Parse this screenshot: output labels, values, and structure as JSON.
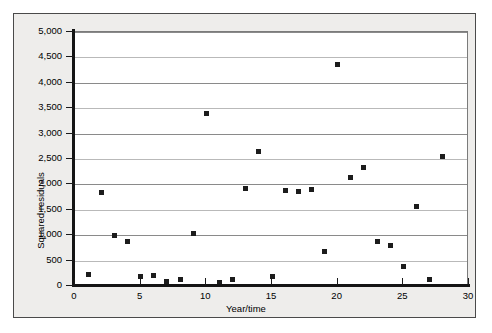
{
  "chart_data": {
    "type": "scatter",
    "title": "",
    "xlabel": "Year/time",
    "ylabel": "Squared residuals",
    "xlim": [
      0,
      30
    ],
    "ylim": [
      0,
      5000
    ],
    "grid": "horizontal",
    "legend": "none",
    "marker": "square",
    "marker_color": "#1c1c1c",
    "xticks": [
      0,
      5,
      10,
      15,
      20,
      25,
      30
    ],
    "xtick_labels": [
      "0",
      "5",
      "10",
      "15",
      "20",
      "25",
      "30"
    ],
    "yticks": [
      0,
      500,
      1000,
      1500,
      2000,
      2500,
      3000,
      3500,
      4000,
      4500,
      5000
    ],
    "ytick_labels": [
      "0",
      "500",
      "1,000",
      "1,500",
      "2,000",
      "2,500",
      "3,000",
      "3,500",
      "4,000",
      "4,500",
      "5,000"
    ],
    "x": [
      1,
      2,
      3,
      4,
      5,
      6,
      7,
      8,
      9,
      10,
      11,
      12,
      13,
      14,
      15,
      16,
      17,
      18,
      19,
      20,
      21,
      22,
      23,
      24,
      25,
      26,
      27,
      28
    ],
    "y": [
      230,
      1850,
      1000,
      880,
      180,
      210,
      80,
      120,
      1030,
      3400,
      70,
      120,
      1910,
      2650,
      190,
      1880,
      1860,
      1890,
      680,
      4360,
      2130,
      2330,
      880,
      800,
      390,
      1570,
      120,
      2550
    ],
    "points": [
      {
        "x": 1,
        "y": 230
      },
      {
        "x": 2,
        "y": 1850
      },
      {
        "x": 3,
        "y": 1000
      },
      {
        "x": 4,
        "y": 880
      },
      {
        "x": 5,
        "y": 180
      },
      {
        "x": 6,
        "y": 210
      },
      {
        "x": 7,
        "y": 80
      },
      {
        "x": 8,
        "y": 120
      },
      {
        "x": 9,
        "y": 1030
      },
      {
        "x": 10,
        "y": 3400
      },
      {
        "x": 11,
        "y": 70
      },
      {
        "x": 12,
        "y": 120
      },
      {
        "x": 13,
        "y": 1910
      },
      {
        "x": 14,
        "y": 2650
      },
      {
        "x": 15,
        "y": 190
      },
      {
        "x": 16,
        "y": 1880
      },
      {
        "x": 17,
        "y": 1860
      },
      {
        "x": 18,
        "y": 1890
      },
      {
        "x": 19,
        "y": 680
      },
      {
        "x": 20,
        "y": 4360
      },
      {
        "x": 21,
        "y": 2130
      },
      {
        "x": 22,
        "y": 2330
      },
      {
        "x": 23,
        "y": 880
      },
      {
        "x": 24,
        "y": 800
      },
      {
        "x": 25,
        "y": 390
      },
      {
        "x": 26,
        "y": 1570
      },
      {
        "x": 27,
        "y": 120
      },
      {
        "x": 28,
        "y": 2550
      }
    ]
  }
}
